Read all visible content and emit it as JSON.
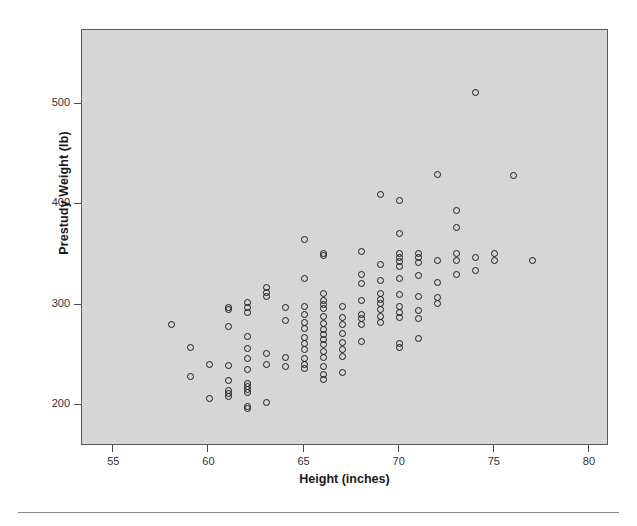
{
  "chart_data": {
    "type": "scatter",
    "title": "",
    "xlabel": "Height (inches)",
    "ylabel": "Prestudy Weight (lb)",
    "xlim": [
      53.3,
      81.0
    ],
    "ylim": [
      160,
      575
    ],
    "xticks": [
      55,
      60,
      65,
      70,
      75,
      80
    ],
    "yticks": [
      200,
      300,
      400,
      500
    ],
    "xtick_labels": [
      "55",
      "60",
      "65",
      "70",
      "75",
      "80"
    ],
    "ytick_labels": [
      "200",
      "300",
      "400",
      "500"
    ],
    "grid": false,
    "legend": null,
    "marker": "open-circle",
    "plot_background": "#d6d6d6",
    "marker_color": "#1a1a1a",
    "n_points": 148,
    "points": [
      [
        58.0,
        281
      ],
      [
        59.0,
        258
      ],
      [
        59.0,
        229
      ],
      [
        60.0,
        241
      ],
      [
        60.0,
        207
      ],
      [
        61.0,
        298
      ],
      [
        61.0,
        296
      ],
      [
        61.0,
        279
      ],
      [
        61.0,
        240
      ],
      [
        61.0,
        225
      ],
      [
        61.0,
        215
      ],
      [
        61.0,
        212
      ],
      [
        61.0,
        209
      ],
      [
        62.0,
        303
      ],
      [
        62.0,
        298
      ],
      [
        62.0,
        293
      ],
      [
        62.0,
        269
      ],
      [
        62.0,
        257
      ],
      [
        62.0,
        247
      ],
      [
        62.0,
        236
      ],
      [
        62.0,
        222
      ],
      [
        62.0,
        219
      ],
      [
        62.0,
        216
      ],
      [
        62.0,
        213
      ],
      [
        62.0,
        199
      ],
      [
        62.0,
        197
      ],
      [
        63.0,
        318
      ],
      [
        63.0,
        313
      ],
      [
        63.0,
        309
      ],
      [
        63.0,
        252
      ],
      [
        63.0,
        241
      ],
      [
        63.0,
        203
      ],
      [
        64.0,
        298
      ],
      [
        64.0,
        285
      ],
      [
        64.0,
        248
      ],
      [
        64.0,
        239
      ],
      [
        65.0,
        366
      ],
      [
        65.0,
        327
      ],
      [
        65.0,
        299
      ],
      [
        65.0,
        291
      ],
      [
        65.0,
        283
      ],
      [
        65.0,
        277
      ],
      [
        65.0,
        268
      ],
      [
        65.0,
        262
      ],
      [
        65.0,
        256
      ],
      [
        65.0,
        247
      ],
      [
        65.0,
        241
      ],
      [
        65.0,
        237
      ],
      [
        66.0,
        352
      ],
      [
        66.0,
        350
      ],
      [
        66.0,
        312
      ],
      [
        66.0,
        305
      ],
      [
        66.0,
        301
      ],
      [
        66.0,
        297
      ],
      [
        66.0,
        289
      ],
      [
        66.0,
        282
      ],
      [
        66.0,
        276
      ],
      [
        66.0,
        271
      ],
      [
        66.0,
        266
      ],
      [
        66.0,
        261
      ],
      [
        66.0,
        254
      ],
      [
        66.0,
        248
      ],
      [
        66.0,
        239
      ],
      [
        66.0,
        231
      ],
      [
        66.0,
        226
      ],
      [
        67.0,
        299
      ],
      [
        67.0,
        288
      ],
      [
        67.0,
        281
      ],
      [
        67.0,
        272
      ],
      [
        67.0,
        263
      ],
      [
        67.0,
        256
      ],
      [
        67.0,
        249
      ],
      [
        67.0,
        233
      ],
      [
        68.0,
        354
      ],
      [
        68.0,
        331
      ],
      [
        68.0,
        322
      ],
      [
        68.0,
        305
      ],
      [
        68.0,
        291
      ],
      [
        68.0,
        287
      ],
      [
        68.0,
        281
      ],
      [
        68.0,
        264
      ],
      [
        69.0,
        411
      ],
      [
        69.0,
        341
      ],
      [
        69.0,
        325
      ],
      [
        69.0,
        312
      ],
      [
        69.0,
        306
      ],
      [
        69.0,
        302
      ],
      [
        69.0,
        296
      ],
      [
        69.0,
        289
      ],
      [
        69.0,
        283
      ],
      [
        70.0,
        405
      ],
      [
        70.0,
        372
      ],
      [
        70.0,
        352
      ],
      [
        70.0,
        348
      ],
      [
        70.0,
        344
      ],
      [
        70.0,
        339
      ],
      [
        70.0,
        327
      ],
      [
        70.0,
        311
      ],
      [
        70.0,
        299
      ],
      [
        70.0,
        293
      ],
      [
        70.0,
        288
      ],
      [
        70.0,
        262
      ],
      [
        70.0,
        258
      ],
      [
        71.0,
        352
      ],
      [
        71.0,
        348
      ],
      [
        71.0,
        343
      ],
      [
        71.0,
        330
      ],
      [
        71.0,
        309
      ],
      [
        71.0,
        295
      ],
      [
        71.0,
        287
      ],
      [
        71.0,
        267
      ],
      [
        72.0,
        431
      ],
      [
        72.0,
        345
      ],
      [
        72.0,
        323
      ],
      [
        72.0,
        308
      ],
      [
        72.0,
        302
      ],
      [
        73.0,
        395
      ],
      [
        73.0,
        378
      ],
      [
        73.0,
        352
      ],
      [
        73.0,
        345
      ],
      [
        73.0,
        331
      ],
      [
        74.0,
        513
      ],
      [
        74.0,
        348
      ],
      [
        74.0,
        335
      ],
      [
        75.0,
        352
      ],
      [
        75.0,
        345
      ],
      [
        76.0,
        430
      ],
      [
        77.0,
        345
      ]
    ]
  }
}
